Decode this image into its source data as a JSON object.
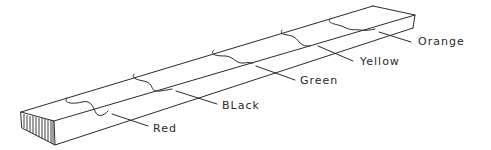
{
  "diagram": {
    "type": "hand-drawn sketch",
    "ink_color": "#2a2a2a",
    "background": "#ffffff",
    "labels": [
      {
        "id": "red",
        "text": "Red",
        "x": 153,
        "y": 123
      },
      {
        "id": "black",
        "text": "BLack",
        "x": 222,
        "y": 100
      },
      {
        "id": "green",
        "text": "Green",
        "x": 300,
        "y": 75
      },
      {
        "id": "yellow",
        "text": "Yellow",
        "x": 360,
        "y": 56
      },
      {
        "id": "orange",
        "text": "Orange",
        "x": 418,
        "y": 36
      }
    ]
  }
}
